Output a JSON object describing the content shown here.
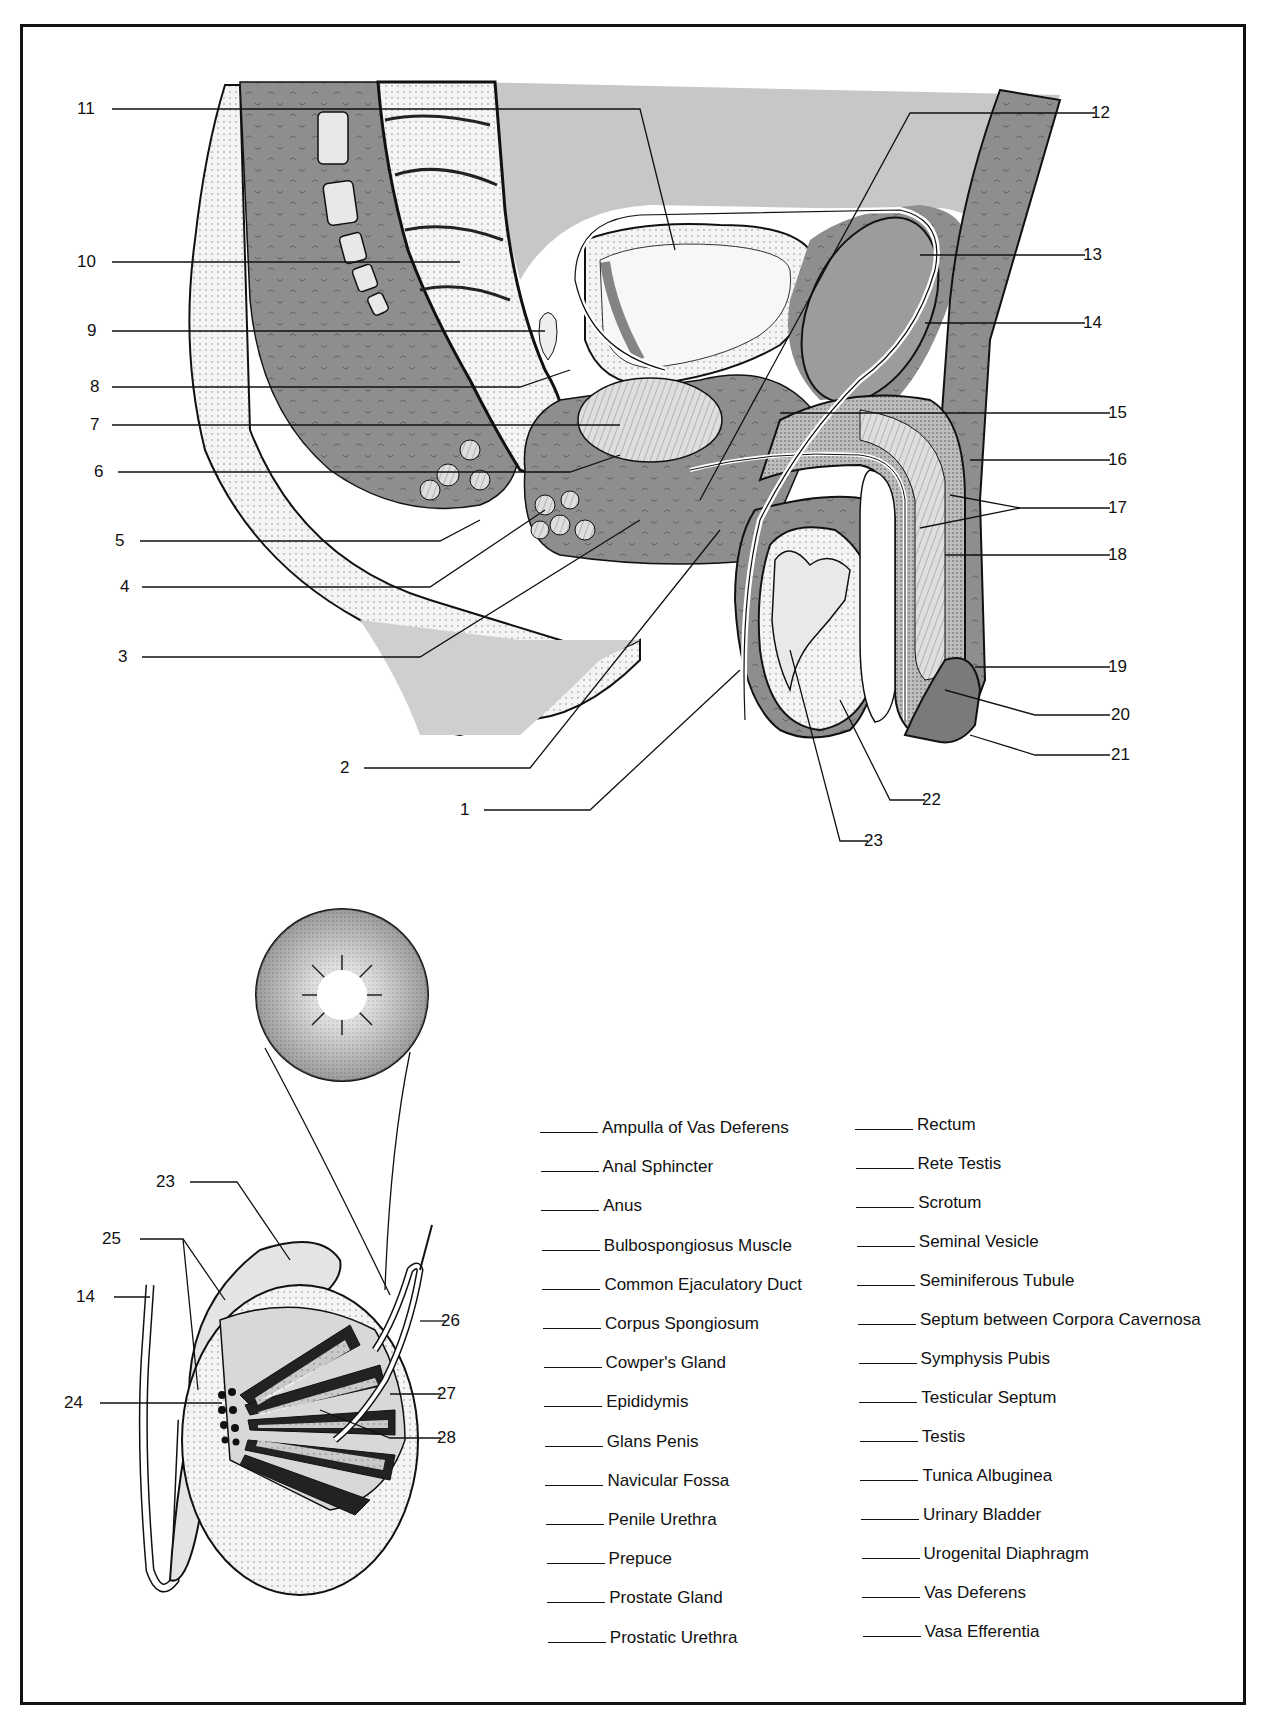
{
  "page": {
    "type": "anatomy-labeling-worksheet",
    "figures": [
      "sagittal-section-male-pelvis",
      "testis-and-epididymis-section",
      "seminiferous-tubule-cross-section"
    ]
  },
  "callouts": {
    "main": [
      {
        "n": "1",
        "x": 470,
        "y": 810
      },
      {
        "n": "2",
        "x": 350,
        "y": 768
      },
      {
        "n": "3",
        "x": 128,
        "y": 657
      },
      {
        "n": "4",
        "x": 130,
        "y": 587
      },
      {
        "n": "5",
        "x": 125,
        "y": 541
      },
      {
        "n": "6",
        "x": 104,
        "y": 472
      },
      {
        "n": "7",
        "x": 100,
        "y": 425
      },
      {
        "n": "8",
        "x": 100,
        "y": 387
      },
      {
        "n": "9",
        "x": 97,
        "y": 331
      },
      {
        "n": "10",
        "x": 87,
        "y": 262
      },
      {
        "n": "11",
        "x": 87,
        "y": 109
      },
      {
        "n": "12",
        "x": 1101,
        "y": 113
      },
      {
        "n": "13",
        "x": 1093,
        "y": 255
      },
      {
        "n": "14",
        "x": 1093,
        "y": 323
      },
      {
        "n": "15",
        "x": 1118,
        "y": 413
      },
      {
        "n": "16",
        "x": 1118,
        "y": 460
      },
      {
        "n": "17",
        "x": 1118,
        "y": 508
      },
      {
        "n": "18",
        "x": 1118,
        "y": 555
      },
      {
        "n": "19",
        "x": 1118,
        "y": 667
      },
      {
        "n": "20",
        "x": 1121,
        "y": 715
      },
      {
        "n": "21",
        "x": 1121,
        "y": 755
      },
      {
        "n": "22",
        "x": 932,
        "y": 800
      },
      {
        "n": "23",
        "x": 874,
        "y": 841
      }
    ],
    "inset": [
      {
        "n": "23",
        "x": 166,
        "y": 1182
      },
      {
        "n": "25",
        "x": 112,
        "y": 1239
      },
      {
        "n": "14",
        "x": 86,
        "y": 1297
      },
      {
        "n": "26",
        "x": 451,
        "y": 1321
      },
      {
        "n": "24",
        "x": 74,
        "y": 1403
      },
      {
        "n": "27",
        "x": 447,
        "y": 1394
      },
      {
        "n": "28",
        "x": 447,
        "y": 1438
      }
    ]
  },
  "word_bank": {
    "left": [
      "Ampulla of Vas Deferens",
      "Anal Sphincter",
      "Anus",
      "Bulbospongiosus Muscle",
      "Common Ejaculatory Duct",
      "Corpus Spongiosum",
      "Cowper's Gland",
      "Epididymis",
      "Glans Penis",
      "Navicular Fossa",
      "Penile Urethra",
      "Prepuce",
      "Prostate Gland",
      "Prostatic Urethra"
    ],
    "right": [
      "Rectum",
      "Rete Testis",
      "Scrotum",
      "Seminal Vesicle",
      "Seminiferous Tubule",
      "Septum between Corpora Cavernosa",
      "Symphysis Pubis",
      "Testicular Septum",
      "Testis",
      "Tunica Albuginea",
      "Urinary Bladder",
      "Urogenital Diaphragm",
      "Vas Deferens",
      "Vasa Efferentia"
    ]
  },
  "colors": {
    "ink": "#111111",
    "light_gray": "#c9c9c9",
    "mid_gray": "#9a9a9a",
    "dark_gray": "#7d7d7d",
    "paper": "#ffffff"
  }
}
